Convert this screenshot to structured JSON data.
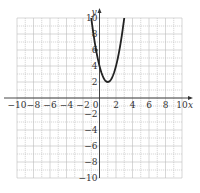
{
  "chart_data": {
    "type": "line",
    "title": "",
    "xlabel": "x",
    "ylabel": "y",
    "xlim": [
      -10,
      10
    ],
    "ylim": [
      -10,
      10
    ],
    "grid": true,
    "x_ticks": [
      -10,
      -8,
      -6,
      -4,
      -2,
      0,
      2,
      4,
      6,
      8,
      10
    ],
    "y_ticks": [
      10,
      8,
      6,
      4,
      2,
      -2,
      -4,
      -6,
      -8,
      -10
    ],
    "x_tick_labels": [
      "−10",
      "−8",
      "−6",
      "−4",
      "−2",
      "0",
      "2",
      "4",
      "6",
      "8",
      "10"
    ],
    "y_tick_labels": [
      "10",
      "8",
      "6",
      "4",
      "2",
      "−2",
      "−4",
      "−6",
      "−8",
      "−10"
    ],
    "series": [
      {
        "name": "parabola",
        "equation": "y = 2(x - 1)^2 + 2",
        "vertex": [
          1,
          2
        ],
        "x_range": [
          -1,
          3
        ],
        "color": "#222222"
      }
    ],
    "points": [
      {
        "x": -0.41,
        "y": 6
      }
    ]
  }
}
